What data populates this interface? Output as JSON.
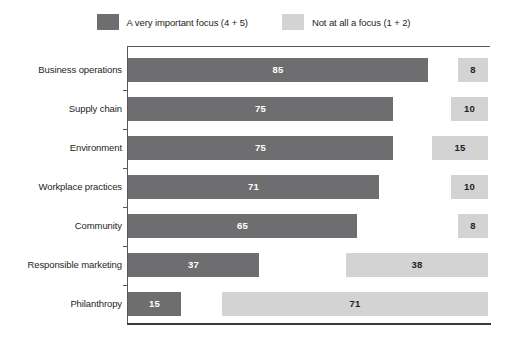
{
  "legend": {
    "entries": [
      {
        "label": "A very important focus (4 + 5)",
        "color": "#6e6e70",
        "icon": "legend-swatch-dark"
      },
      {
        "label": "Not at all a focus (1 + 2)",
        "color": "#d3d3d3",
        "icon": "legend-swatch-light"
      }
    ]
  },
  "colors": {
    "important": "#6e6e70",
    "not_focus": "#d3d3d3",
    "axis": "#58585a",
    "baseline": "#3a3a3c",
    "label_text": "#231f20"
  },
  "chart_data": {
    "type": "bar",
    "orientation": "horizontal",
    "title": "",
    "subtitle": "",
    "xlabel": "",
    "ylabel": "",
    "grid": false,
    "legend_position": "top-center",
    "axis_range": [
      0,
      100
    ],
    "categories": [
      "Business operations",
      "Supply chain",
      "Environment",
      "Workplace practices",
      "Community",
      "Responsible marketing",
      "Philanthropy"
    ],
    "series": [
      {
        "name": "A very important focus (4 + 5)",
        "color": "#6e6e70",
        "align": "left",
        "values": [
          85,
          75,
          75,
          71,
          65,
          37,
          15
        ]
      },
      {
        "name": "Not at all a focus (1 + 2)",
        "color": "#d3d3d3",
        "align": "right",
        "values": [
          8,
          10,
          15,
          10,
          8,
          38,
          71
        ]
      }
    ],
    "rows": [
      {
        "category": "Business operations",
        "important": 85,
        "not_focus": 8
      },
      {
        "category": "Supply chain",
        "important": 75,
        "not_focus": 10
      },
      {
        "category": "Environment",
        "important": 75,
        "not_focus": 15
      },
      {
        "category": "Workplace practices",
        "important": 71,
        "not_focus": 10
      },
      {
        "category": "Community",
        "important": 65,
        "not_focus": 8
      },
      {
        "category": "Responsible marketing",
        "important": 37,
        "not_focus": 38
      },
      {
        "category": "Philanthropy",
        "important": 15,
        "not_focus": 71
      }
    ]
  },
  "layout": {
    "axis_x": 127,
    "plot_right": 488,
    "first_row_top": 58,
    "row_pitch": 39,
    "bar_height": 24,
    "px_per_unit_left": 3.53,
    "px_per_unit_right": 3.74
  }
}
